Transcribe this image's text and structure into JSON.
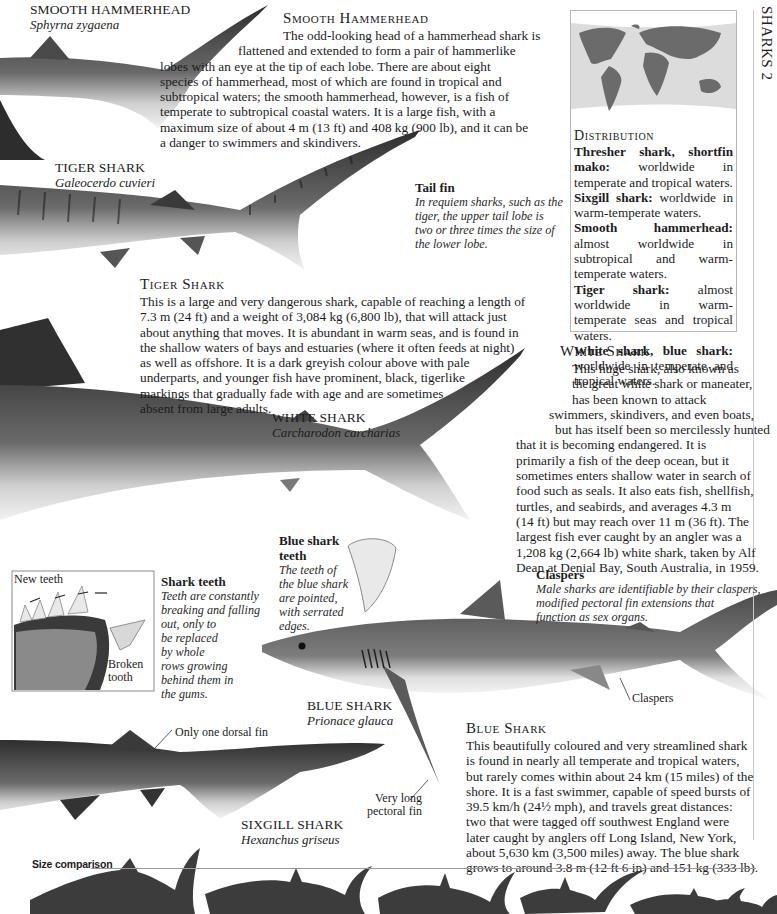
{
  "running_head": "SHARKS 2",
  "smooth_hammerhead": {
    "label_common": "SMOOTH HAMMERHEAD",
    "label_scientific": "Sphyrna zygaena",
    "heading": "Smooth Hammerhead",
    "body_lines": [
      "The odd-looking head of a hammerhead shark is",
      "flattened and extended to form a pair of hammerlike",
      "lobes with an eye at the tip of each lobe. There are about eight",
      "species of hammerhead, most of which are found in tropical and",
      "subtropical waters; the smooth hammerhead, however, is a fish of",
      "temperate to subtropical coastal waters. It is a large fish, with a",
      "maximum size of about 4 m (13 ft) and 408 kg (900 lb), and it can be",
      "a danger to swimmers and skindivers."
    ]
  },
  "distribution": {
    "heading": "Distribution",
    "entries": [
      {
        "species": "Thresher shark, shortfin mako:",
        "range": "worldwide in temperate and tropical waters."
      },
      {
        "species": "Sixgill shark:",
        "range": "worldwide in warm-temperate waters."
      },
      {
        "species": "Smooth hammerhead:",
        "range": "almost worldwide in subtropical and warm-temperate waters."
      },
      {
        "species": "Tiger shark:",
        "range": "almost worldwide in warm-temperate seas and tropical waters."
      },
      {
        "species": "White shark, blue shark:",
        "range": "worldwide in temperate and tropical waters."
      }
    ]
  },
  "tiger_shark": {
    "label_common": "TIGER SHARK",
    "label_scientific": "Galeocerdo cuvieri",
    "heading": "Tiger Shark",
    "body_lines": [
      "This is a large and very dangerous shark, capable of reaching a length of",
      "7.3 m (24 ft) and a weight of 3,084 kg (6,800 lb), that will attack just",
      "about anything that moves. It is abundant in warm seas, and is found in",
      "the shallow waters of bays and estuaries (where it often feeds at night)",
      "as well as offshore. It is a dark greyish colour above with pale",
      "underparts, and younger fish have prominent, black, tigerlike",
      "markings that gradually fade with age and are sometimes",
      "absent from large adults."
    ]
  },
  "tail_fin": {
    "title": "Tail fin",
    "lines": [
      "In requiem sharks, such as the",
      "tiger, the upper tail lobe is",
      "two or three times the size of",
      "the lower lobe."
    ]
  },
  "white_shark": {
    "label_common": "WHITE SHARK",
    "label_scientific": "Carcharodon carcharias",
    "heading": "White Shark",
    "body_lines": [
      "This huge shark, also known as",
      "the great white shark or maneater,",
      "has been known to attack",
      "swimmers, skindivers, and even boats,",
      "but has itself been so mercilessly hunted",
      "that it is becoming endangered. It is",
      "primarily a fish of the deep ocean, but it",
      "sometimes enters shallow water in search of",
      "food such as seals. It also eats fish, shellfish,",
      "turtles, and seabirds, and averages 4.3 m",
      "(14 ft) but may reach over 11 m (36 ft). The",
      "largest fish ever caught by an angler was a",
      "1,208 kg (2,664 lb) white shark, taken by Alf",
      "Dean at Denial Bay, South Australia, in 1959."
    ]
  },
  "shark_teeth": {
    "inset_label_new": "New teeth",
    "inset_label_broken_1": "Broken",
    "inset_label_broken_2": "tooth",
    "title": "Shark teeth",
    "lines": [
      "Teeth are constantly",
      "breaking and falling",
      "out, only to",
      "be replaced",
      "by whole",
      "rows growing",
      "behind them in",
      "the gums."
    ]
  },
  "blue_shark_teeth": {
    "title_1": "Blue shark",
    "title_2": "teeth",
    "lines": [
      "The teeth of",
      "the blue shark",
      "are pointed,",
      "with serrated",
      "edges."
    ]
  },
  "claspers": {
    "title": "Claspers",
    "lines": [
      "Male sharks are identifiable by their claspers,",
      "modified pectoral fin extensions that",
      "function as sex organs."
    ],
    "pointer_label": "Claspers"
  },
  "blue_shark": {
    "label_common": "BLUE SHARK",
    "label_scientific": "Prionace glauca",
    "pointer_label_1": "Very long",
    "pointer_label_2": "pectoral fin",
    "heading": "Blue Shark",
    "body_lines": [
      "This beautifully coloured and very streamlined shark",
      "is found in nearly all temperate and tropical waters,",
      "but rarely comes within about 24 km (15 miles) of the",
      "shore. It is a fast swimmer, capable of speed bursts of",
      "39.5 km/h (24½ mph), and travels great distances:",
      "two that were tagged off southwest England were",
      "later caught by anglers off Long Island, New York,",
      "about 5,630 km (3,500 miles) away. The blue shark",
      "grows to around 3.8 m (12 ft 6 in) and 151 kg (333 lb)."
    ]
  },
  "sixgill_shark": {
    "label_common": "SIXGILL SHARK",
    "label_scientific": "Hexanchus griseus",
    "pointer_label": "Only one dorsal fin"
  },
  "size_comparison": {
    "label": "Size comparison",
    "silhouettes": [
      "white shark",
      "tiger shark",
      "smooth hammerhead",
      "thresher shark",
      "sixgill shark",
      "blue shark",
      "shortfin mako"
    ]
  },
  "colors": {
    "shark_dark": "#3f3f3f",
    "shark_mid": "#6e6e6e",
    "map_land": "#6b6b6b",
    "map_sea": "#dcdcdc",
    "box_border": "#b8b8b8"
  }
}
